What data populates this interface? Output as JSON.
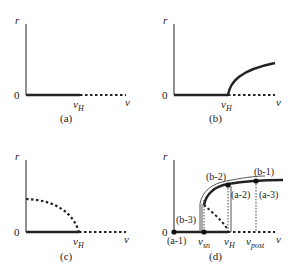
{
  "figure": {
    "panels": [
      {
        "id": "a",
        "caption": "(a)",
        "y_axis_label": "r",
        "x_axis_label": "v",
        "origin_label": "0",
        "tick_label": "v",
        "tick_sub": "H",
        "description": "Solid r=0 from 0 to v_H (stable), dashed r=0 beyond v_H (unstable)"
      },
      {
        "id": "b",
        "caption": "(b)",
        "y_axis_label": "r",
        "x_axis_label": "v",
        "origin_label": "0",
        "tick_label": "v",
        "tick_sub": "H",
        "description": "Supercritical: solid branch rising from v_H"
      },
      {
        "id": "c",
        "caption": "(c)",
        "y_axis_label": "r",
        "x_axis_label": "v",
        "origin_label": "0",
        "tick_label": "v",
        "tick_sub": "H",
        "description": "Subcritical: dashed unstable branch from r-axis down to v_H"
      },
      {
        "id": "d",
        "caption": "(d)",
        "y_axis_label": "r",
        "x_axis_label": "v",
        "origin_label": "0",
        "tick_labels": [
          {
            "main": "v",
            "sub": "sn"
          },
          {
            "main": "v",
            "sub": "H"
          },
          {
            "main": "v",
            "sub": "post"
          }
        ],
        "annotations": [
          "(a-1)",
          "(a-2)",
          "(a-3)",
          "(b-1)",
          "(b-2)",
          "(b-3)"
        ],
        "description": "Hysteresis loop with saddle-node v_sn, Hopf v_H, and v_post"
      }
    ]
  }
}
